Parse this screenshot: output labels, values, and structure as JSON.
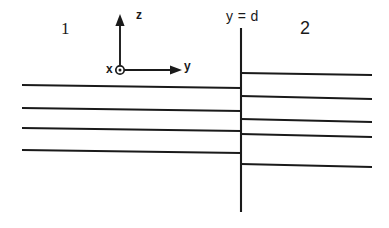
{
  "figure": {
    "background_color": "#ffffff",
    "line_color": "#1a1a1a",
    "width": 389,
    "height": 228
  },
  "labels": {
    "region_1": "1",
    "region_2": "2",
    "interface": "y = d",
    "axis_z": "z",
    "axis_y": "y",
    "axis_x": "x"
  },
  "axes": {
    "origin": {
      "x": 120,
      "y": 70
    },
    "z_axis": {
      "from_y": 70,
      "to_y": 20,
      "arrow": "up"
    },
    "y_axis": {
      "from_x": 120,
      "to_x": 180,
      "arrow": "right"
    },
    "x_axis": {
      "symbol": "circled-dot",
      "meaning": "out-of-page",
      "cx": 120,
      "cy": 70,
      "r_outer": 4.2,
      "r_inner": 1.5
    }
  },
  "interface_line": {
    "x": 241,
    "y_top": 28,
    "y_bottom": 212
  },
  "chart_data": {
    "type": "line",
    "xlabel": "y",
    "ylabel": "z",
    "grid": false,
    "legend": null,
    "annotations": [
      "1",
      "2",
      "y = d",
      "x",
      "y",
      "z"
    ],
    "series": [
      {
        "name": "region-1-wavefronts",
        "count": 4,
        "x_start": 22,
        "x_end": 241,
        "lines": [
          {
            "y_start": 85,
            "y_end": 88
          },
          {
            "y_start": 108,
            "y_end": 111
          },
          {
            "y_start": 128,
            "y_end": 131
          },
          {
            "y_start": 150,
            "y_end": 153
          }
        ]
      },
      {
        "name": "region-2-wavefronts",
        "count": 5,
        "x_start": 241,
        "x_end": 372,
        "lines": [
          {
            "y_start": 73,
            "y_end": 75
          },
          {
            "y_start": 96,
            "y_end": 99
          },
          {
            "y_start": 119,
            "y_end": 122
          },
          {
            "y_start": 134,
            "y_end": 137
          },
          {
            "y_start": 164,
            "y_end": 167
          }
        ]
      }
    ]
  }
}
